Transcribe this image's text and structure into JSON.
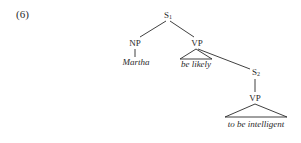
{
  "example_number": "(6)",
  "tree": {
    "root": {
      "label": "S",
      "subscript": "1"
    },
    "np": {
      "label": "NP",
      "terminal": "Martha"
    },
    "vp1": {
      "label": "VP",
      "terminal": "be likely"
    },
    "s2": {
      "label": "S",
      "subscript": "2"
    },
    "vp2": {
      "label": "VP",
      "terminal": "to be intelligent"
    }
  },
  "colors": {
    "ink": "#2a2a2a",
    "background": "#ffffff"
  }
}
